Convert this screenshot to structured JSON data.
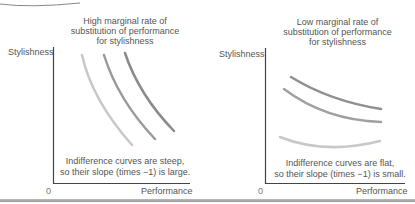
{
  "panels": [
    {
      "id": "high-mrs",
      "title_lines": [
        "High marginal rate of",
        "substitution of performance",
        "for stylishness"
      ],
      "y_axis_label": "Stylishness",
      "x_axis_label": "Performance",
      "origin_label": "0",
      "caption_lines": [
        "Indifference curves are steep,",
        "so their slope (times −1) is large."
      ],
      "curve_colors": [
        "#c8c8c8",
        "#9a9a9a",
        "#8a8a8a"
      ]
    },
    {
      "id": "low-mrs",
      "title_lines": [
        "Low marginal rate of",
        "substitution of performance",
        "for stylishness"
      ],
      "y_axis_label": "Stylishness",
      "x_axis_label": "Performance",
      "origin_label": "0",
      "caption_lines": [
        "Indifference curves are flat,",
        "so their slope (times −1) is small."
      ],
      "curve_colors": [
        "#c8c8c8",
        "#a0a0a0",
        "#8f8f8f"
      ]
    }
  ]
}
